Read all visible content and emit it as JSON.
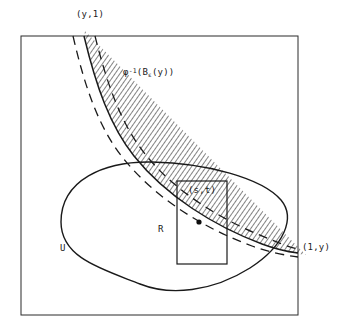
{
  "figure": {
    "kind": "mathematical-diagram",
    "background_color": "#ffffff",
    "ink_color": "#1a1a1a"
  },
  "labels": {
    "top_corner_point": "(y,1)",
    "band_label_prefix": "φ",
    "band_label_exponent": "-1",
    "band_label_open": "(B",
    "band_label_subscript": "ε",
    "band_label_rest": "(y))",
    "band_label_full": "φ⁻¹(Bε(y))",
    "point_label": "(s,t)",
    "rectangle_label": "R",
    "region_label": "U",
    "right_corner_point": "(1,y)"
  },
  "geometry": {
    "square": {
      "x": 21,
      "y": 36,
      "width": 277,
      "height": 279
    },
    "rectangle_R": {
      "x": 177,
      "y": 181,
      "width": 50,
      "height": 83
    },
    "marked_point": {
      "x": 199,
      "y": 222,
      "radius": 2.6
    },
    "band_center_path": "M 84,36 C 96,86 110,126 134,156 C 166,196 214,226 262,244 C 278,250 290,252 298,253",
    "band_half_width": 11,
    "region_U_path": "M 61,222 C 61,180 104,161 152,162 C 206,163 262,178 281,200 C 296,218 284,246 250,268 C 212,292 170,296 140,284 C 102,269 61,258 61,222 Z",
    "hatch_spacing": 4,
    "dash_pattern": "9 6"
  },
  "colors": {
    "line": "#1a1a1a",
    "hatch": "#1a1a1a",
    "dashed_boundary": "#1a1a1a",
    "page": "#ffffff"
  }
}
